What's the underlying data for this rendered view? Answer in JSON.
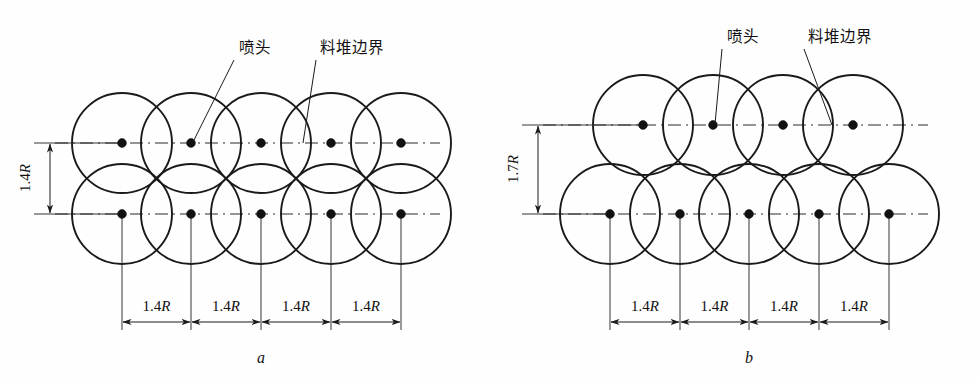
{
  "figure": {
    "background_color": "#fefefe",
    "stroke_color": "#1a1a1a",
    "dot_color": "#111111"
  },
  "labels": {
    "nozzle": "喷头",
    "pile_boundary": "料堆边界"
  },
  "dimensions": {
    "horizontal_value": "1.4R",
    "horizontal_number": "1.4",
    "horizontal_unit": "R",
    "vertical_a_number": "1.4",
    "vertical_a_unit": "R",
    "vertical_b_number": "1.7",
    "vertical_b_unit": "R",
    "vertical_a_value": "1.4R",
    "vertical_b_value": "1.7R"
  },
  "panels": [
    {
      "id": "a",
      "caption": "a",
      "caption_x": 261,
      "caption_y": 363,
      "arrangement": "square-grid",
      "circle_radius": 50,
      "row_top_y": 143,
      "row_bottom_y": 214,
      "top_row_centers_x": [
        122,
        191,
        261,
        331,
        401
      ],
      "bottom_row_centers_x": [
        122,
        191,
        261,
        331,
        401
      ],
      "vertical_dim_label": "1.4R",
      "vertical_dim_x": 50,
      "vertical_ext_left_x": 34,
      "vertical_label_x": 30,
      "vertical_label_y": 178,
      "dim_line_y": 322,
      "dim_text_y": 311,
      "ext_line_bottom_y": 330,
      "dim_stations_x": [
        122,
        191,
        261,
        331,
        401
      ],
      "dim_spans": [
        {
          "x1": 122,
          "x2": 191,
          "label": "1.4R"
        },
        {
          "x1": 191,
          "x2": 261,
          "label": "1.4R"
        },
        {
          "x1": 261,
          "x2": 331,
          "label": "1.4R"
        },
        {
          "x1": 331,
          "x2": 401,
          "label": "1.4R"
        }
      ],
      "centerline_top": {
        "x1": 55,
        "x2": 440,
        "y": 143
      },
      "centerline_bottom": {
        "x1": 55,
        "x2": 440,
        "y": 214
      },
      "nozzle_label": {
        "text": "喷头",
        "x": 239,
        "y": 53
      },
      "nozzle_leader": {
        "x1": 234,
        "y1": 60,
        "x2": 193,
        "y2": 142
      },
      "boundary_label": {
        "text": "料堆边界",
        "x": 320,
        "y": 53
      },
      "boundary_leader": {
        "x1": 316,
        "y1": 60,
        "x2": 303,
        "y2": 143
      }
    },
    {
      "id": "b",
      "caption": "b",
      "caption_x": 749,
      "caption_y": 363,
      "arrangement": "staggered-offset",
      "circle_radius": 50,
      "row_top_y": 125,
      "row_bottom_y": 214,
      "top_row_centers_x": [
        643,
        713,
        783,
        853
      ],
      "bottom_row_centers_x": [
        610,
        680,
        749,
        819,
        889
      ],
      "vertical_dim_label": "1.7R",
      "vertical_dim_x": 538,
      "vertical_ext_left_x": 522,
      "vertical_label_x": 518,
      "vertical_label_y": 169,
      "dim_line_y": 322,
      "dim_text_y": 311,
      "ext_line_bottom_y": 330,
      "dim_stations_x": [
        610,
        680,
        749,
        819,
        889
      ],
      "dim_spans": [
        {
          "x1": 610,
          "x2": 680,
          "label": "1.4R"
        },
        {
          "x1": 680,
          "x2": 749,
          "label": "1.4R"
        },
        {
          "x1": 749,
          "x2": 819,
          "label": "1.4R"
        },
        {
          "x1": 819,
          "x2": 889,
          "label": "1.4R"
        }
      ],
      "centerline_top": {
        "x1": 543,
        "x2": 928,
        "y": 125
      },
      "centerline_bottom": {
        "x1": 543,
        "x2": 928,
        "y": 214
      },
      "nozzle_label": {
        "text": "喷头",
        "x": 727,
        "y": 42
      },
      "nozzle_leader": {
        "x1": 722,
        "y1": 49,
        "x2": 715,
        "y2": 124
      },
      "boundary_label": {
        "text": "料堆边界",
        "x": 808,
        "y": 42
      },
      "boundary_leader": {
        "x1": 804,
        "y1": 49,
        "x2": 832,
        "y2": 125
      }
    }
  ]
}
